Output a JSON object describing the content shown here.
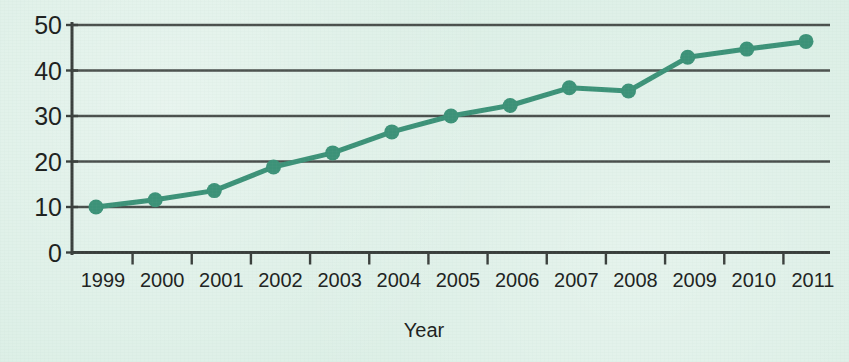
{
  "chart_data": {
    "type": "line",
    "title": "",
    "xlabel": "Year",
    "ylabel": "",
    "categories": [
      "1999",
      "2000",
      "2001",
      "2002",
      "2003",
      "2004",
      "2005",
      "2006",
      "2007",
      "2008",
      "2009",
      "2010",
      "2011"
    ],
    "values": [
      10.0,
      11.6,
      13.6,
      18.8,
      21.9,
      26.5,
      30.0,
      32.3,
      36.2,
      35.5,
      42.9,
      44.7,
      46.4
    ],
    "series": [
      {
        "name": "series-1",
        "values": [
          10.0,
          11.6,
          13.6,
          18.8,
          21.9,
          26.5,
          30.0,
          32.3,
          36.2,
          35.5,
          42.9,
          44.7,
          46.4
        ]
      }
    ],
    "ylim": [
      0,
      50
    ],
    "yticks": [
      0,
      10,
      20,
      30,
      40,
      50
    ],
    "ytick_labels": [
      "0",
      "10",
      "20",
      "30",
      "40",
      "50"
    ],
    "xtick_labels": [
      "1999",
      "2000",
      "2001",
      "2002",
      "2003",
      "2004",
      "2005",
      "2006",
      "2007",
      "2008",
      "2009",
      "2010",
      "2011"
    ],
    "grid": true,
    "legend": false,
    "legend_position": "none",
    "marker": "circle",
    "line_color": "#3c9278",
    "marker_color": "#3c9278",
    "grid_color": "#4a4f4c",
    "axis_color": "#3a3f3c",
    "background_color": "#dcefe6",
    "text_color": "#1d1f1e"
  },
  "axis": {
    "x_title": "Year"
  }
}
